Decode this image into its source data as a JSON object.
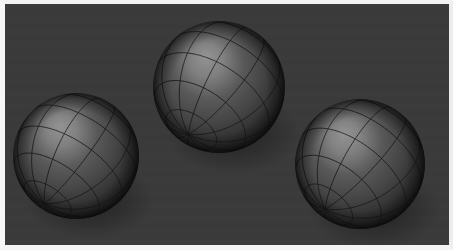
{
  "scene": {
    "title": "Three shaded wireframe spheres",
    "renderer_kind": "3d-raster-render",
    "canvas": {
      "width": 453,
      "height": 250
    },
    "frame": {
      "border_color": "#f2f2f2",
      "border_width_px": 4
    },
    "background": {
      "color": "#3b3b3b",
      "shade_dark": "#313131",
      "shade_light": "#424242",
      "texture": "flat-noisy-gray"
    },
    "light": {
      "direction": "upper-left",
      "highlight_color": "#8a8a8a",
      "midtone_color": "#595959",
      "terminator_color": "#1a1a1a",
      "shadow_color": "#0d0d0d"
    },
    "wireframe": {
      "line_color": "#1c1c1c",
      "line_width_px": 0.9,
      "meridian_count": 12,
      "parallel_count": 6
    },
    "objects": [
      {
        "name": "sphere-left",
        "label": "Left sphere",
        "center_x": 76,
        "center_y": 156,
        "radius": 63,
        "pole_x": 53,
        "pole_y": 173,
        "highlight_x": 60,
        "highlight_y": 126,
        "pole_tilt_deg": 28,
        "pole_spin_deg": -18
      },
      {
        "name": "sphere-middle",
        "label": "Middle sphere",
        "center_x": 219,
        "center_y": 87,
        "radius": 66,
        "pole_x": 186,
        "pole_y": 105,
        "highlight_x": 206,
        "highlight_y": 56,
        "pole_tilt_deg": 34,
        "pole_spin_deg": -24
      },
      {
        "name": "sphere-right",
        "label": "Right sphere",
        "center_x": 360,
        "center_y": 164,
        "radius": 65,
        "pole_x": 330,
        "pole_y": 180,
        "highlight_x": 344,
        "highlight_y": 133,
        "pole_tilt_deg": 31,
        "pole_spin_deg": -21
      }
    ]
  }
}
